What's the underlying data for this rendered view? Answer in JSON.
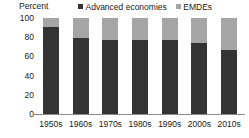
{
  "chart_data": {
    "type": "bar",
    "subtype": "stacked-100-percent-vertical",
    "title": "",
    "xlabel": "",
    "ylabel": "Percent",
    "ylim": [
      0,
      100
    ],
    "yticks": [
      0,
      20,
      40,
      60,
      80,
      100
    ],
    "grid": false,
    "legend_position": "top-right",
    "categories": [
      "1950s",
      "1960s",
      "1970s",
      "1980s",
      "1990s",
      "2000s",
      "2010s"
    ],
    "series": [
      {
        "name": "Advanced economies",
        "color": "#333333",
        "values": [
          91,
          79,
          77,
          77,
          77,
          74,
          67
        ]
      },
      {
        "name": "EMDEs",
        "color": "#a5a5a5",
        "values": [
          9,
          21,
          23,
          23,
          23,
          26,
          33
        ]
      }
    ]
  },
  "axis": {
    "unit_label": "Percent",
    "ytick_labels": [
      "100",
      "80",
      "60",
      "40",
      "20",
      "0"
    ]
  },
  "legend": {
    "items": [
      {
        "label": "Advanced economies",
        "color": "#333333"
      },
      {
        "label": "EMDEs",
        "color": "#a5a5a5"
      }
    ]
  }
}
